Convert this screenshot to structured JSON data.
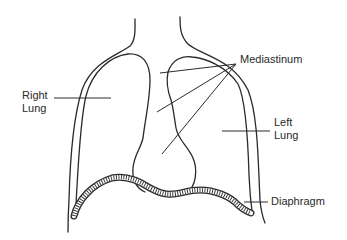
{
  "diagram": {
    "type": "anatomical-line-drawing",
    "labels": {
      "right_lung": "Right\nLung",
      "left_lung": "Left\nLung",
      "mediastinum": "Mediastinum",
      "diaphragm": "Diaphragm"
    },
    "colors": {
      "stroke": "#2a2a2a",
      "background": "#ffffff"
    }
  }
}
